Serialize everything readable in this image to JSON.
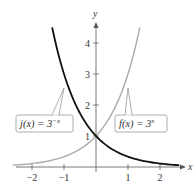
{
  "chart_data": {
    "type": "line",
    "title": "",
    "xlabel": "x",
    "ylabel": "y",
    "xlim": [
      -2.5,
      2.7
    ],
    "ylim": [
      -0.1,
      4.6
    ],
    "grid": false,
    "x_ticks": [
      -2,
      -1,
      1,
      2
    ],
    "x_tick_labels": [
      "−2",
      "−1",
      "1",
      "2"
    ],
    "y_ticks": [
      1,
      2,
      3,
      4
    ],
    "y_tick_labels": [
      "1",
      "2",
      "3",
      "4"
    ],
    "series": [
      {
        "name": "j(x) = 3^(-x)",
        "label_base": "j(x) = 3",
        "label_exp": "−x",
        "formula": "3^(-x)",
        "color": "#111111",
        "domain": [
          -1.37,
          2.6
        ],
        "points": [
          [
            -1.37,
            4.5
          ],
          [
            -1,
            3
          ],
          [
            -0.5,
            1.73
          ],
          [
            0,
            1
          ],
          [
            0.5,
            0.58
          ],
          [
            1,
            0.333
          ],
          [
            1.5,
            0.192
          ],
          [
            2,
            0.111
          ],
          [
            2.6,
            0.057
          ]
        ]
      },
      {
        "name": "f(x) = 3^x",
        "label_base": "f(x) = 3",
        "label_exp": "x",
        "formula": "3^x",
        "color": "#aaaaaa",
        "domain": [
          -2.6,
          1.37
        ],
        "points": [
          [
            -2.6,
            0.057
          ],
          [
            -2,
            0.111
          ],
          [
            -1.5,
            0.192
          ],
          [
            -1,
            0.333
          ],
          [
            -0.5,
            0.58
          ],
          [
            0,
            1
          ],
          [
            0.5,
            1.73
          ],
          [
            1,
            3
          ],
          [
            1.37,
            4.5
          ]
        ]
      }
    ],
    "annotations": [
      {
        "text": "j(x) = 3^(-x)",
        "points_to": [
          -1,
          3
        ],
        "series": 0
      },
      {
        "text": "f(x) = 3^x",
        "points_to": [
          1,
          3
        ],
        "series": 1
      }
    ]
  }
}
